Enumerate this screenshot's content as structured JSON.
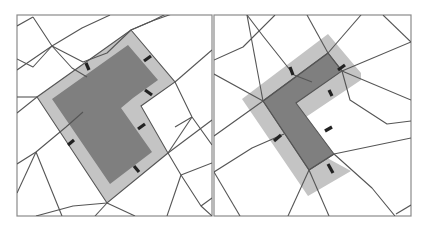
{
  "figure": {
    "colors": {
      "background": "#ffffff",
      "frame": "#8a8a8a",
      "mesh_line": "#555555",
      "light_band": "#c4c4c4",
      "dark_core": "#7f7f7f",
      "tick_mark": "#222222"
    },
    "panels": [
      {
        "id": "left",
        "frame": {
          "x": 17,
          "y": 15,
          "w": 195,
          "h": 201
        },
        "light_polygon": "131,30 175,82 141,106 168,153 107,203 37,97",
        "dark_polygon": "128,45 158,80 133,98 121,108 152,152 110,184 52,99",
        "mesh_lines": [
          "17,26 33,17",
          "17,70 52,46 82,28 110,15",
          "17,59 33,67 52,46 83,62 107,53 131,30 152,21 166,14",
          "33,17 52,46 72,68 87,77",
          "17,97 37,97",
          "37,97 17,113",
          "17,164 36,152 66,127 83,112",
          "17,193 36,152",
          "36,152 62,216",
          "107,203 95,216",
          "107,203 135,216",
          "107,203 73,206 36,216",
          "168,153 181,175 201,206 212,216",
          "168,153 212,120",
          "175,82 192,117 212,145",
          "175,82 212,50",
          "192,117 168,153",
          "131,30 152,21 183,10",
          "181,175 212,163",
          "181,175 167,216",
          "201,206 212,198",
          "192,117 175,127"
        ],
        "ticks": [
          {
            "x1": 86,
            "y1": 63,
            "x2": 89,
            "y2": 70
          },
          {
            "x1": 144,
            "y1": 61,
            "x2": 151,
            "y2": 56
          },
          {
            "x1": 145,
            "y1": 90,
            "x2": 152,
            "y2": 95
          },
          {
            "x1": 138,
            "y1": 129,
            "x2": 145,
            "y2": 124
          },
          {
            "x1": 68,
            "y1": 145,
            "x2": 74,
            "y2": 140
          },
          {
            "x1": 134,
            "y1": 166,
            "x2": 139,
            "y2": 172
          }
        ]
      },
      {
        "id": "right",
        "frame": {
          "x": 214,
          "y": 15,
          "w": 197,
          "h": 201
        },
        "light_polygon": "328,34 361,73 361,80 300,121 329,159 351,171 308,196 242,99",
        "dark_polygon": "328,53 342,71 296,103 334,154 309,170 263,101",
        "mesh_lines": [
          "214,60 243,47 275,15",
          "247,15 263,101",
          "247,15 263,36 294,75 312,82",
          "307,15 328,53",
          "328,53 342,71 350,100 387,124 411,121",
          "342,71 411,42",
          "328,53 361,15",
          "383,15 411,42",
          "214,74 263,101 214,136",
          "263,101 328,53",
          "263,101 309,170",
          "309,170 334,154 411,138",
          "334,154 372,188 395,216",
          "309,170 288,216",
          "309,170 329,216",
          "214,172 252,148 284,134",
          "214,172 240,216",
          "396,214 411,205",
          "342,71 411,100"
        ],
        "ticks": [
          {
            "x1": 290,
            "y1": 67,
            "x2": 293,
            "y2": 75
          },
          {
            "x1": 338,
            "y1": 70,
            "x2": 345,
            "y2": 65
          },
          {
            "x1": 329,
            "y1": 90,
            "x2": 332,
            "y2": 96
          },
          {
            "x1": 325,
            "y1": 131,
            "x2": 332,
            "y2": 127
          },
          {
            "x1": 274,
            "y1": 141,
            "x2": 281,
            "y2": 135
          },
          {
            "x1": 328,
            "y1": 164,
            "x2": 333,
            "y2": 173
          }
        ]
      }
    ]
  }
}
